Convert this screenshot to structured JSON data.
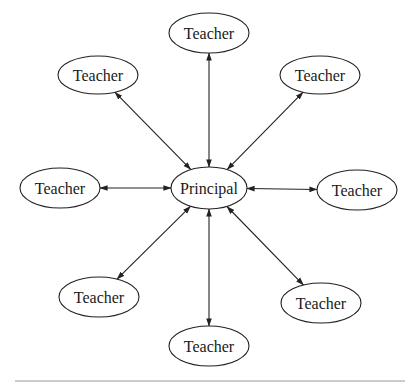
{
  "diagram": {
    "type": "hub-and-spoke",
    "center": {
      "id": "principal",
      "label": "Principal",
      "cx": 209,
      "cy": 188,
      "rx": 38,
      "ry": 21
    },
    "nodes": [
      {
        "id": "teacher-top",
        "label": "Teacher",
        "cx": 209,
        "cy": 33,
        "rx": 40,
        "ry": 20
      },
      {
        "id": "teacher-upper-left",
        "label": "Teacher",
        "cx": 98,
        "cy": 75,
        "rx": 40,
        "ry": 19
      },
      {
        "id": "teacher-upper-right",
        "label": "Teacher",
        "cx": 320,
        "cy": 75,
        "rx": 40,
        "ry": 19
      },
      {
        "id": "teacher-left",
        "label": "Teacher",
        "cx": 60,
        "cy": 188,
        "rx": 40,
        "ry": 20
      },
      {
        "id": "teacher-right",
        "label": "Teacher",
        "cx": 357,
        "cy": 190,
        "rx": 40,
        "ry": 20
      },
      {
        "id": "teacher-lower-left",
        "label": "Teacher",
        "cx": 99,
        "cy": 297,
        "rx": 40,
        "ry": 20
      },
      {
        "id": "teacher-lower-right",
        "label": "Teacher",
        "cx": 321,
        "cy": 303,
        "rx": 40,
        "ry": 20
      },
      {
        "id": "teacher-bottom",
        "label": "Teacher",
        "cx": 209,
        "cy": 346,
        "rx": 40,
        "ry": 20
      }
    ],
    "edges": [
      {
        "from": "principal",
        "to": "teacher-top",
        "bidirectional": true
      },
      {
        "from": "principal",
        "to": "teacher-upper-left",
        "bidirectional": true
      },
      {
        "from": "principal",
        "to": "teacher-upper-right",
        "bidirectional": true
      },
      {
        "from": "principal",
        "to": "teacher-left",
        "bidirectional": true
      },
      {
        "from": "principal",
        "to": "teacher-right",
        "bidirectional": true
      },
      {
        "from": "principal",
        "to": "teacher-lower-left",
        "bidirectional": true
      },
      {
        "from": "principal",
        "to": "teacher-lower-right",
        "bidirectional": true
      },
      {
        "from": "principal",
        "to": "teacher-bottom",
        "bidirectional": true
      }
    ],
    "colors": {
      "stroke": "#222222",
      "text": "#1a1a1a",
      "background": "#ffffff",
      "rule": "#9a9a9a"
    }
  }
}
